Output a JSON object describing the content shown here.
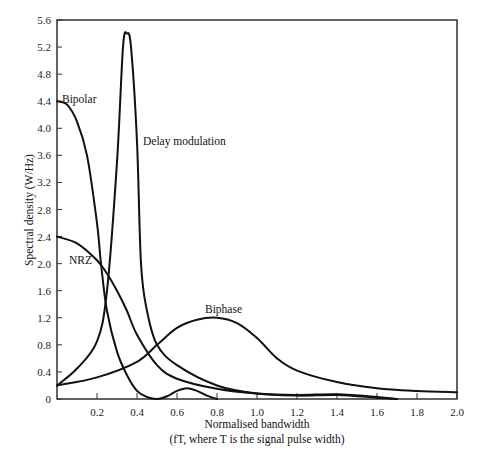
{
  "chart_data": {
    "type": "line",
    "title": "",
    "xlabel": "Normalised bandwidth",
    "xlabel_sub": "(fT, where T is the signal pulse width)",
    "ylabel": "Spectral density (W/Hz)",
    "xlim": [
      0,
      2.0
    ],
    "ylim": [
      0,
      5.6
    ],
    "x_ticks": [
      "0.2",
      "0.4",
      "0.6",
      "0.8",
      "1.0",
      "1.2",
      "1.4",
      "1.6",
      "1.8",
      "2.0"
    ],
    "y_ticks": [
      "0",
      "0.4",
      "0.8",
      "1.2",
      "1.6",
      "2.0",
      "2.4",
      "2.8",
      "3.2",
      "3.6",
      "4.0",
      "4.4",
      "4.8",
      "5.2",
      "5.6"
    ],
    "grid": false,
    "legend": "inline labels",
    "series": [
      {
        "name": "Bipolar",
        "x": [
          0,
          0.05,
          0.1,
          0.15,
          0.2,
          0.22,
          0.25,
          0.3,
          0.35,
          0.4,
          0.45,
          0.5,
          0.55,
          0.6,
          0.65,
          0.7,
          0.75,
          0.8
        ],
        "values": [
          4.4,
          4.35,
          4.1,
          3.6,
          2.6,
          2.0,
          1.3,
          0.7,
          0.35,
          0.12,
          0.03,
          0.0,
          0.04,
          0.12,
          0.16,
          0.12,
          0.05,
          0.0
        ]
      },
      {
        "name": "NRZ",
        "x": [
          0,
          0.1,
          0.2,
          0.25,
          0.3,
          0.35,
          0.4,
          0.5,
          0.6,
          0.8,
          1.0,
          1.2,
          1.4,
          1.6,
          1.7
        ],
        "values": [
          2.4,
          2.3,
          2.05,
          1.85,
          1.6,
          1.3,
          0.95,
          0.5,
          0.3,
          0.15,
          0.08,
          0.06,
          0.07,
          0.03,
          0.0
        ]
      },
      {
        "name": "Delay modulation",
        "x": [
          0,
          0.1,
          0.2,
          0.25,
          0.3,
          0.33,
          0.35,
          0.37,
          0.4,
          0.42,
          0.45,
          0.5,
          0.6,
          0.8,
          1.0,
          1.2,
          1.4,
          1.6,
          1.7
        ],
        "values": [
          0.2,
          0.45,
          0.85,
          1.6,
          3.5,
          5.2,
          5.4,
          5.2,
          3.8,
          2.0,
          1.3,
          0.8,
          0.5,
          0.2,
          0.08,
          0.05,
          0.06,
          0.02,
          0.0
        ]
      },
      {
        "name": "Biphase",
        "x": [
          0,
          0.2,
          0.4,
          0.5,
          0.6,
          0.7,
          0.8,
          0.9,
          1.0,
          1.1,
          1.2,
          1.4,
          1.6,
          1.8,
          2.0
        ],
        "values": [
          0.2,
          0.32,
          0.55,
          0.8,
          1.05,
          1.17,
          1.2,
          1.12,
          0.9,
          0.6,
          0.42,
          0.25,
          0.16,
          0.12,
          0.1
        ]
      }
    ]
  }
}
